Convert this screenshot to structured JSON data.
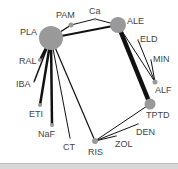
{
  "diagram": {
    "type": "network",
    "node_color": "#999999",
    "edge_color": "#111111",
    "nodes": [
      {
        "id": "PLA",
        "label": "PLA",
        "x": 51,
        "y": 38,
        "r": 12,
        "lx": 20,
        "ly": 35
      },
      {
        "id": "PAM",
        "label": "PAM",
        "x": 71,
        "y": 25,
        "r": 2.5,
        "lx": 56,
        "ly": 18
      },
      {
        "id": "Ca",
        "label": "Ca",
        "x": 95,
        "y": 19,
        "r": 1.5,
        "lx": 89,
        "ly": 14
      },
      {
        "id": "ALE",
        "label": "ALE",
        "x": 118,
        "y": 25,
        "r": 8,
        "lx": 127,
        "ly": 24
      },
      {
        "id": "ELD",
        "label": "ELD",
        "x": 138,
        "y": 40,
        "r": 1,
        "lx": 140,
        "ly": 42
      },
      {
        "id": "MIN",
        "label": "MIN",
        "x": 151,
        "y": 60,
        "r": 1,
        "lx": 153,
        "ly": 62
      },
      {
        "id": "ALF",
        "label": "ALF",
        "x": 155,
        "y": 82,
        "r": 2.5,
        "lx": 155,
        "ly": 93
      },
      {
        "id": "TPTD",
        "label": "TPTD",
        "x": 150,
        "y": 104,
        "r": 5.5,
        "lx": 146,
        "ly": 118
      },
      {
        "id": "DEN",
        "label": "DEN",
        "x": 138,
        "y": 124,
        "r": 1,
        "lx": 136,
        "ly": 135
      },
      {
        "id": "ZOL",
        "label": "ZOL",
        "x": 116,
        "y": 136,
        "r": 1,
        "lx": 115,
        "ly": 147
      },
      {
        "id": "RIS",
        "label": "RIS",
        "x": 95,
        "y": 141,
        "r": 3,
        "lx": 88,
        "ly": 155
      },
      {
        "id": "CT",
        "label": "CT",
        "x": 70,
        "y": 138,
        "r": 1,
        "lx": 63,
        "ly": 150
      },
      {
        "id": "NaF",
        "label": "NaF",
        "x": 52,
        "y": 125,
        "r": 2,
        "lx": 38,
        "ly": 137
      },
      {
        "id": "ETI",
        "label": "ETI",
        "x": 40,
        "y": 105,
        "r": 2,
        "lx": 29,
        "ly": 117
      },
      {
        "id": "IBA",
        "label": "IBA",
        "x": 34,
        "y": 82,
        "r": 0.8,
        "lx": 16,
        "ly": 87
      },
      {
        "id": "RAL",
        "label": "RAL",
        "x": 40,
        "y": 60,
        "r": 2,
        "lx": 19,
        "ly": 64
      }
    ],
    "edges": [
      {
        "from": "PLA",
        "to": "PAM",
        "w": 1.4
      },
      {
        "from": "PLA",
        "to": "ALE",
        "w": 2
      },
      {
        "from": "PAM",
        "to": "Ca",
        "w": 1
      },
      {
        "from": "Ca",
        "to": "ALE",
        "w": 1
      },
      {
        "from": "PLA",
        "to": "RAL",
        "w": 2.5
      },
      {
        "from": "PLA",
        "to": "IBA",
        "w": 1.5
      },
      {
        "from": "PLA",
        "to": "ETI",
        "w": 2.5
      },
      {
        "from": "PLA",
        "to": "NaF",
        "w": 2.5
      },
      {
        "from": "PLA",
        "to": "CT",
        "w": 1
      },
      {
        "from": "PLA",
        "to": "RIS",
        "w": 1.2
      },
      {
        "from": "ALE",
        "to": "TPTD",
        "w": 4.5
      },
      {
        "from": "ALE",
        "to": "ALF",
        "w": 1
      },
      {
        "from": "ELD",
        "to": "ALF",
        "w": 1
      },
      {
        "from": "MIN",
        "to": "ALF",
        "w": 1
      },
      {
        "from": "RIS",
        "to": "TPTD",
        "w": 1
      },
      {
        "from": "RIS",
        "to": "DEN",
        "w": 1
      },
      {
        "from": "RIS",
        "to": "ZOL",
        "w": 1
      }
    ]
  }
}
